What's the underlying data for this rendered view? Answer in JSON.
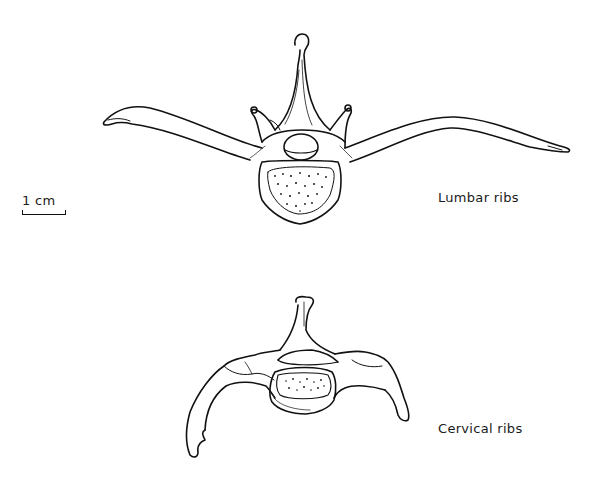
{
  "figure": {
    "scale_bar": {
      "label": "1 cm"
    },
    "specimens": [
      {
        "id": "lumbar",
        "label": "Lumbar ribs"
      },
      {
        "id": "cervical",
        "label": "Cervical ribs"
      }
    ]
  },
  "colors": {
    "ink": "#111111",
    "background": "#ffffff"
  }
}
